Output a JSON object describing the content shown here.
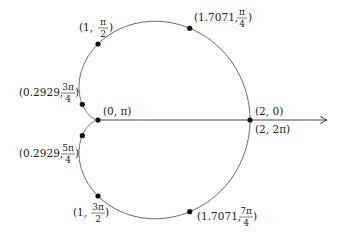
{
  "diagram": {
    "type": "polar-cardioid",
    "equation": "r = 1 + cos θ",
    "pole": {
      "x": 98,
      "y": 120
    },
    "scale_px_per_unit": 76,
    "colors": {
      "curve": "#555555",
      "axis": "#333333",
      "dot": "#111111",
      "text": "#222222"
    },
    "polar_axis": {
      "from_x": 98,
      "to_x": 327,
      "y": 120,
      "arrow": true
    },
    "points": [
      {
        "id": "p0",
        "r": 2,
        "theta": "0",
        "label_r": "2",
        "label_theta": "0",
        "x": 250,
        "y": 120
      },
      {
        "id": "p1",
        "r": 1.7071,
        "theta": "π/4",
        "label_r": "1.7071",
        "theta_num": "π",
        "theta_den": "4",
        "x": 189.7,
        "y": 28.3
      },
      {
        "id": "p2",
        "r": 1,
        "theta": "π/2",
        "label_r": "1",
        "theta_num": "π",
        "theta_den": "2",
        "x": 98,
        "y": 44
      },
      {
        "id": "p3",
        "r": 0.2929,
        "theta": "3π/4",
        "label_r": "0.2929",
        "theta_num": "3π",
        "theta_den": "4",
        "x": 82.3,
        "y": 104.3
      },
      {
        "id": "p4",
        "r": 0,
        "theta": "π",
        "label_r": "0",
        "label_theta": "π",
        "x": 98,
        "y": 120
      },
      {
        "id": "p5",
        "r": 0.2929,
        "theta": "5π/4",
        "label_r": "0.2929",
        "theta_num": "5π",
        "theta_den": "4",
        "x": 82.3,
        "y": 135.7
      },
      {
        "id": "p6",
        "r": 1,
        "theta": "3π/2",
        "label_r": "1",
        "theta_num": "3π",
        "theta_den": "2",
        "x": 98,
        "y": 196
      },
      {
        "id": "p7",
        "r": 1.7071,
        "theta": "7π/4",
        "label_r": "1.7071",
        "theta_num": "7π",
        "theta_den": "4",
        "x": 189.7,
        "y": 211.7
      },
      {
        "id": "p8",
        "r": 2,
        "theta": "2π",
        "label_r": "2",
        "label_theta": "2π",
        "x": 250,
        "y": 120
      }
    ],
    "labels": {
      "p0": "(2, 0)",
      "p8": "(2, 2π)",
      "p4": "(0, π)",
      "p1_prefix": "(1.7071,",
      "p2_prefix": "(1,",
      "p3_prefix": "(0.2929,",
      "p5_prefix": "(0.2929,",
      "p6_prefix": "(1,",
      "p7_prefix": "(1.7071,",
      "close": ")"
    }
  }
}
